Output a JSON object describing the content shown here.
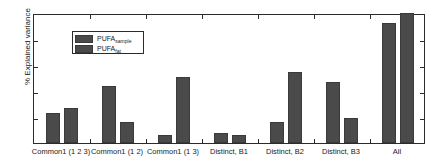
{
  "chart_data": {
    "type": "bar",
    "title": "",
    "xlabel": "",
    "ylabel": "% Explained variance",
    "ylim": [
      0,
      100
    ],
    "yticks": [
      0,
      20,
      40,
      60,
      80,
      100
    ],
    "ytick_labels": [
      "0",
      "20",
      "40",
      "60",
      "80",
      "100"
    ],
    "grid": false,
    "legend_position": "upper-left",
    "categories": [
      "Common1 (1 2 3)",
      "Common1 (1 2)",
      "Common1 (1 3)",
      "Distinct, B1",
      "Distinct, B2",
      "Distinct, B3",
      "All"
    ],
    "series": [
      {
        "name": "PUFA_sample",
        "label_base": "PUFA",
        "label_sub": "sample",
        "color": "#4a4a4a",
        "values": [
          23,
          44,
          6,
          8,
          16,
          47,
          92
        ]
      },
      {
        "name": "PUFA_fat",
        "label_base": "PUFA",
        "label_sub": "fat",
        "color": "#4a4a4a",
        "values": [
          27,
          16,
          51,
          6,
          55,
          19,
          100
        ]
      }
    ]
  },
  "axes": {
    "frame_color": "#2b2b2b",
    "background": "#ffffff"
  }
}
